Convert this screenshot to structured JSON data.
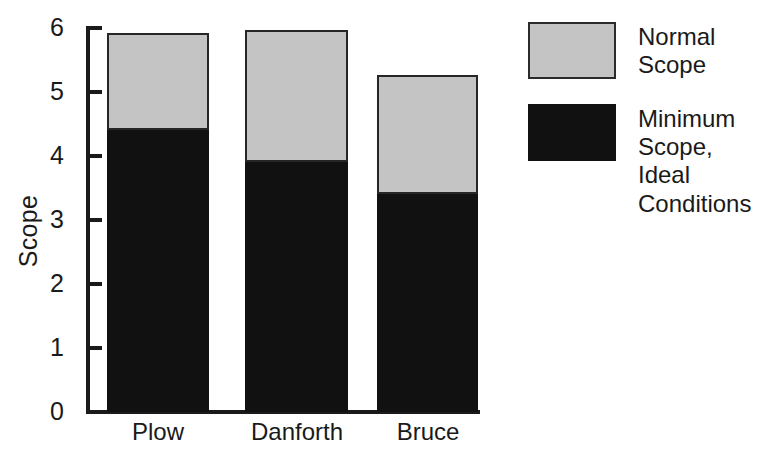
{
  "chart_data": {
    "type": "bar",
    "subtype": "stacked-vertical",
    "title": "",
    "xlabel": "",
    "ylabel": "Scope",
    "categories": [
      "Plow",
      "Danforth",
      "Bruce"
    ],
    "series": [
      {
        "name": "Minimum Scope, Ideal Conditions",
        "color": "#111111",
        "values": [
          4.4,
          3.9,
          3.4
        ]
      },
      {
        "name": "Normal Scope",
        "color": "#c4c4c4",
        "values": [
          1.5,
          2.05,
          1.85
        ]
      }
    ],
    "totals": [
      5.9,
      5.95,
      5.25
    ],
    "ylim": [
      0,
      6
    ],
    "yticks": [
      0,
      1,
      2,
      3,
      4,
      5,
      6
    ],
    "ytick_labels": [
      "0",
      "1",
      "2",
      "3",
      "4",
      "5",
      "6"
    ],
    "grid": false,
    "legend_position": "right"
  },
  "axis": {
    "y_title": "Scope",
    "y_ticks": [
      "6",
      "5",
      "4",
      "3",
      "2",
      "1",
      "0"
    ]
  },
  "legend": {
    "entries": [
      {
        "label": "Normal\nScope",
        "swatch": "normal"
      },
      {
        "label": "Minimum\nScope,\nIdeal\nConditions",
        "swatch": "minimum"
      }
    ]
  },
  "colors": {
    "normal_scope": "#c4c4c4",
    "minimum_scope": "#111111",
    "axis": "#1a1a1a",
    "background": "#ffffff"
  }
}
